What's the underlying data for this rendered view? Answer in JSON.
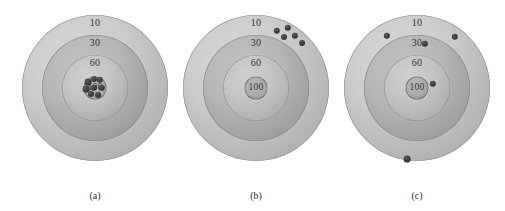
{
  "figure": {
    "type": "target-diagram",
    "background_color": "#ffffff",
    "shot_color": "#2f2f2f",
    "ring_values": [
      "10",
      "30",
      "60",
      "100"
    ],
    "targets": [
      {
        "id": "a",
        "caption": "(a)",
        "labels": {
          "r10": "10",
          "r30": "30",
          "r60": "60",
          "r100": "100"
        },
        "shots": [
          {
            "x": 66,
            "y": 74,
            "r": 3.4
          },
          {
            "x": 72,
            "y": 71,
            "r": 3.0
          },
          {
            "x": 78,
            "y": 72,
            "r": 3.2
          },
          {
            "x": 64,
            "y": 81,
            "r": 3.4
          },
          {
            "x": 80,
            "y": 80,
            "r": 3.2
          },
          {
            "x": 69,
            "y": 86,
            "r": 3.0
          },
          {
            "x": 76,
            "y": 87,
            "r": 3.0
          },
          {
            "x": 72,
            "y": 80,
            "r": 3.2
          }
        ]
      },
      {
        "id": "b",
        "caption": "(b)",
        "labels": {
          "r10": "10",
          "r30": "30",
          "r60": "60",
          "r100": "100"
        },
        "shots": [
          {
            "x": 94,
            "y": 23,
            "r": 3.2
          },
          {
            "x": 105,
            "y": 20,
            "r": 3.2
          },
          {
            "x": 101,
            "y": 29,
            "r": 3.0
          },
          {
            "x": 112,
            "y": 28,
            "r": 3.2
          },
          {
            "x": 119,
            "y": 35,
            "r": 3.0
          }
        ]
      },
      {
        "id": "c",
        "caption": "(c)",
        "labels": {
          "r10": "10",
          "r30": "30",
          "r60": "60",
          "r100": "100"
        },
        "shots": [
          {
            "x": 43,
            "y": 28,
            "r": 3.2
          },
          {
            "x": 111,
            "y": 29,
            "r": 3.2
          },
          {
            "x": 81,
            "y": 36,
            "r": 3.2
          },
          {
            "x": 89,
            "y": 76,
            "r": 3.2
          },
          {
            "x": 63,
            "y": 151,
            "r": 3.4
          }
        ]
      }
    ]
  }
}
